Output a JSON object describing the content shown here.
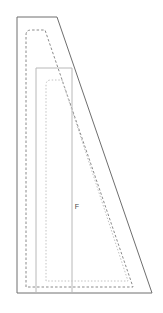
{
  "document": {
    "type": "technical-pattern-drawing",
    "background_color": "#ffffff",
    "width": 163,
    "height": 313
  },
  "piece": {
    "label": "F",
    "label_position": {
      "x": 77,
      "y": 207
    }
  },
  "colors": {
    "cutting_line": "#6e6e6e",
    "seam_line": "#8a8a8a",
    "grain_box_line": "#b8b8b8",
    "inner_fold_line": "#c2c2c2",
    "label_text": "#4a4a4a"
  },
  "shapes": {
    "cutting_line": {
      "name": "outer-cutting-line",
      "style": "solid",
      "stroke": "#6e6e6e",
      "stroke_width": 1,
      "points": "17,17 57,17 152,293 17,293"
    },
    "seam_allowance_line": {
      "name": "seam-allowance-line",
      "style": "dashed",
      "stroke": "#8a8a8a",
      "stroke_width": 1,
      "dash_pattern": "2.5 2",
      "path": "M 26,287 L 26,35 Q 26,30 31,30 L 45,30 L 133,287 Z"
    },
    "grain_box": {
      "name": "grain-reference-box",
      "style": "solid",
      "stroke": "#b8b8b8",
      "stroke_width": 1,
      "points": "36,68 72,68 72,293 36,293"
    },
    "inner_fold_line": {
      "name": "inner-fold-line",
      "style": "dotted",
      "stroke": "#c2c2c2",
      "stroke_width": 1,
      "dash_pattern": "1.5 1.8",
      "path": "M 46,281 L 46,85 Q 46,80 51,80 L 62,80 L 128,281 Z"
    }
  }
}
